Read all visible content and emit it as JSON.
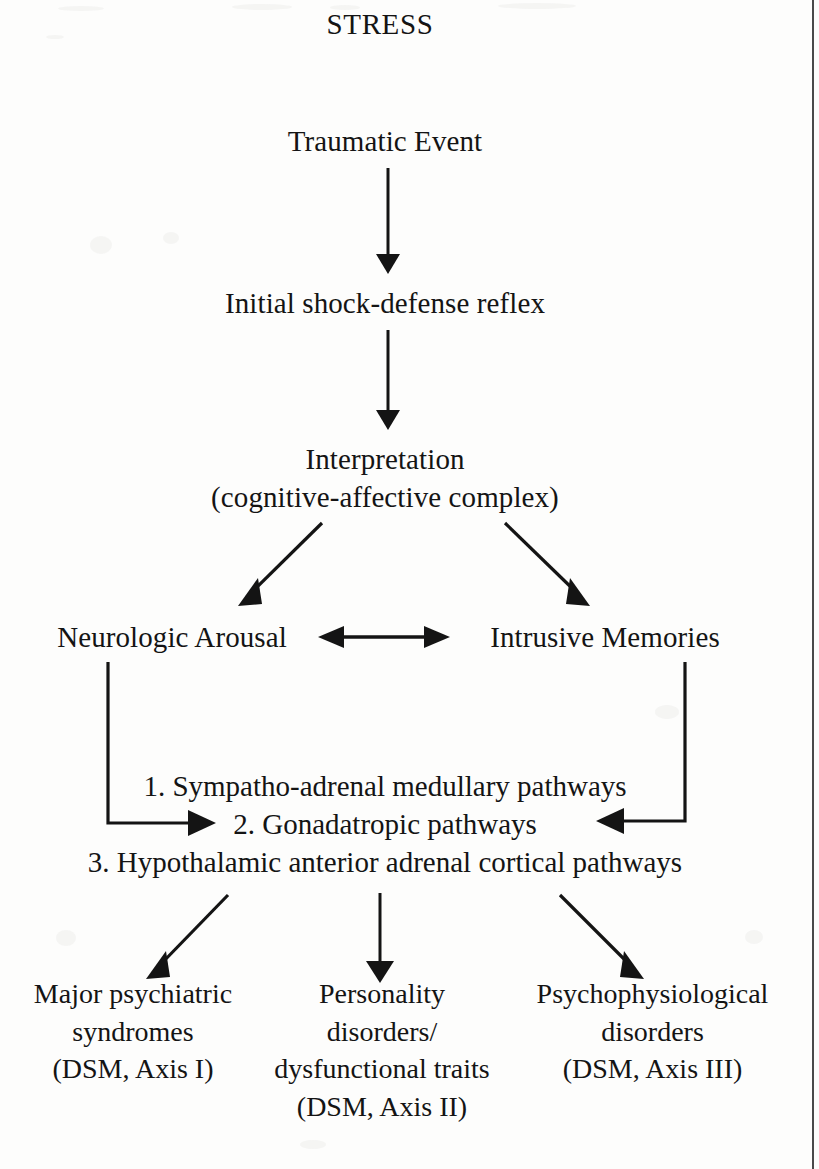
{
  "document": {
    "title": "STRESS",
    "type": "flowchart-diagram"
  },
  "nodes": {
    "title": "STRESS",
    "traumatic_event": "Traumatic Event",
    "initial_shock": "Initial shock-defense reflex",
    "interpretation_line1": "Interpretation",
    "interpretation_line2": "(cognitive-affective complex)",
    "neurologic_arousal": "Neurologic Arousal",
    "intrusive_memories": "Intrusive Memories"
  },
  "pathways": {
    "item1": "1. Sympatho-adrenal medullary pathways",
    "item2": "2. Gonadatropic pathways",
    "item3": "3. Hypothalamic anterior adrenal cortical pathways"
  },
  "outcomes": [
    {
      "name": "major-psychiatric-syndromes",
      "text": "Major psychiatric\nsyndromes\n(DSM, Axis I)"
    },
    {
      "name": "personality-disorders",
      "text": "Personality\ndisorders/\ndysfunctional traits\n(DSM, Axis II)"
    },
    {
      "name": "psychophysiological-disorders",
      "text": "Psychophysiological\ndisorders\n(DSM, Axis III)"
    }
  ],
  "colors": {
    "ink": "#141414",
    "paper": "#fdfdfc",
    "rule": "#4a4a4a"
  }
}
